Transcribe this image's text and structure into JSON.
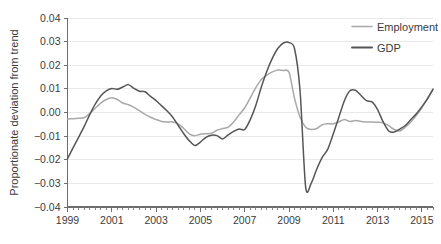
{
  "chart_data": {
    "type": "line",
    "title": "",
    "xlabel": "",
    "ylabel": "Proportionate deviation from trend",
    "xlim": [
      1999.0,
      2015.5
    ],
    "ylim": [
      -0.04,
      0.04
    ],
    "grid": true,
    "legend_position": "top-right",
    "y_ticks": [
      "0.04",
      "0.03",
      "0.02",
      "0.01",
      "0.00",
      "−0.01",
      "−0.02",
      "−0.03",
      "−0.04"
    ],
    "y_tick_values": [
      0.04,
      0.03,
      0.02,
      0.01,
      0.0,
      -0.01,
      -0.02,
      -0.03,
      -0.04
    ],
    "x_ticks": [
      "1999",
      "2001",
      "2003",
      "2005",
      "2007",
      "2009",
      "2011",
      "2013",
      "2015"
    ],
    "x_tick_values": [
      1999,
      2001,
      2003,
      2005,
      2007,
      2009,
      2011,
      2013,
      2015
    ],
    "x_minor_step": 0.25,
    "series": [
      {
        "name": "Employment",
        "color": "#a9a9a9",
        "x": [
          1999.0,
          1999.25,
          1999.5,
          1999.75,
          2000.0,
          2000.25,
          2000.5,
          2000.75,
          2001.0,
          2001.25,
          2001.5,
          2001.75,
          2002.0,
          2002.25,
          2002.5,
          2002.75,
          2003.0,
          2003.25,
          2003.5,
          2003.75,
          2004.0,
          2004.25,
          2004.5,
          2004.75,
          2005.0,
          2005.25,
          2005.5,
          2005.75,
          2006.0,
          2006.25,
          2006.5,
          2006.75,
          2007.0,
          2007.25,
          2007.5,
          2007.75,
          2008.0,
          2008.25,
          2008.5,
          2008.75,
          2009.0,
          2009.25,
          2009.5,
          2009.75,
          2010.0,
          2010.25,
          2010.5,
          2010.75,
          2011.0,
          2011.25,
          2011.5,
          2011.75,
          2012.0,
          2012.25,
          2012.5,
          2012.75,
          2013.0,
          2013.25,
          2013.5,
          2013.75,
          2014.0,
          2014.25,
          2014.5,
          2014.75,
          2015.0,
          2015.25,
          2015.5
        ],
        "values": [
          -0.0028,
          -0.0026,
          -0.0024,
          -0.0022,
          -0.0005,
          0.0018,
          0.004,
          0.0055,
          0.0062,
          0.0055,
          0.004,
          0.0033,
          0.0022,
          0.0008,
          -0.0008,
          -0.002,
          -0.003,
          -0.0038,
          -0.004,
          -0.004,
          -0.0048,
          -0.0068,
          -0.009,
          -0.0098,
          -0.0092,
          -0.009,
          -0.0088,
          -0.0075,
          -0.0068,
          -0.0062,
          -0.004,
          -0.001,
          0.002,
          0.0062,
          0.0105,
          0.014,
          0.0158,
          0.0172,
          0.018,
          0.0178,
          0.017,
          0.006,
          -0.002,
          -0.0062,
          -0.0072,
          -0.0068,
          -0.0052,
          -0.0048,
          -0.0048,
          -0.004,
          -0.003,
          -0.0038,
          -0.0034,
          -0.0038,
          -0.004,
          -0.004,
          -0.0041,
          -0.0044,
          -0.0056,
          -0.0072,
          -0.0078,
          -0.0062,
          -0.004,
          -0.0012,
          0.002,
          0.006,
          0.01
        ]
      },
      {
        "name": "GDP",
        "color": "#565656",
        "x": [
          1999.0,
          1999.25,
          1999.5,
          1999.75,
          2000.0,
          2000.25,
          2000.5,
          2000.75,
          2001.0,
          2001.25,
          2001.5,
          2001.75,
          2002.0,
          2002.25,
          2002.5,
          2002.75,
          2003.0,
          2003.25,
          2003.5,
          2003.75,
          2004.0,
          2004.25,
          2004.5,
          2004.75,
          2005.0,
          2005.25,
          2005.5,
          2005.75,
          2006.0,
          2006.25,
          2006.5,
          2006.75,
          2007.0,
          2007.25,
          2007.5,
          2007.75,
          2008.0,
          2008.25,
          2008.5,
          2008.75,
          2009.0,
          2009.25,
          2009.5,
          2009.75,
          2010.0,
          2010.25,
          2010.5,
          2010.75,
          2011.0,
          2011.25,
          2011.5,
          2011.75,
          2012.0,
          2012.25,
          2012.5,
          2012.75,
          2013.0,
          2013.25,
          2013.5,
          2013.75,
          2014.0,
          2014.25,
          2014.5,
          2014.75,
          2015.0,
          2015.25,
          2015.5
        ],
        "values": [
          -0.0195,
          -0.015,
          -0.0105,
          -0.006,
          -0.001,
          0.0035,
          0.007,
          0.0092,
          0.0102,
          0.0098,
          0.0108,
          0.0118,
          0.0102,
          0.009,
          0.0088,
          0.0068,
          0.005,
          0.0028,
          0.0006,
          -0.002,
          -0.0055,
          -0.009,
          -0.012,
          -0.014,
          -0.0125,
          -0.0105,
          -0.0096,
          -0.0098,
          -0.0112,
          -0.0095,
          -0.008,
          -0.007,
          -0.0072,
          -0.003,
          0.003,
          0.0108,
          0.0175,
          0.023,
          0.0272,
          0.0294,
          0.0296,
          0.027,
          0.009,
          -0.0315,
          -0.03,
          -0.024,
          -0.019,
          -0.0155,
          -0.009,
          -0.002,
          0.005,
          0.0092,
          0.0094,
          0.0072,
          0.005,
          0.0045,
          0.0012,
          -0.004,
          -0.0078,
          -0.0083,
          -0.007,
          -0.0055,
          -0.003,
          -0.0005,
          0.0025,
          0.0058,
          0.0098
        ]
      }
    ]
  },
  "legend": {
    "items": [
      {
        "label": "Employment",
        "color": "#a9a9a9"
      },
      {
        "label": "GDP",
        "color": "#565656"
      }
    ]
  }
}
